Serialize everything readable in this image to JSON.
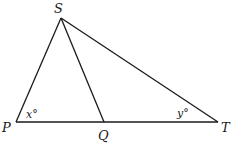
{
  "diagram": {
    "type": "triangle",
    "vertices": {
      "S": {
        "label": "S",
        "x": 61,
        "y": 18
      },
      "P": {
        "label": "P",
        "x": 16,
        "y": 122
      },
      "Q": {
        "label": "Q",
        "x": 104,
        "y": 122
      },
      "T": {
        "label": "T",
        "x": 218,
        "y": 122
      }
    },
    "segments": [
      "SP",
      "SQ",
      "ST",
      "PT"
    ],
    "angles": {
      "P": {
        "label": "x°",
        "variable": "x"
      },
      "T": {
        "label": "y°",
        "variable": "y"
      }
    },
    "colors": {
      "stroke": "#1a1a1a",
      "background": "#ffffff"
    }
  }
}
